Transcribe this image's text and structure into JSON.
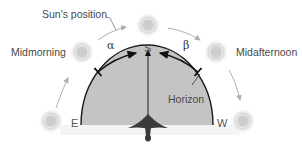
{
  "diagram": {
    "labels": {
      "sun_position": "Sun's position",
      "midmorning": "Midmorning",
      "midafternoon": "Midafternoon",
      "south": "S",
      "east": "E",
      "west": "W",
      "horizon": "Horizon",
      "alpha": "α",
      "beta": "β"
    },
    "suns": [
      {
        "name": "sunrise-east",
        "x": 51,
        "y": 121
      },
      {
        "name": "midmorning",
        "x": 82,
        "y": 52
      },
      {
        "name": "noon-south",
        "x": 148,
        "y": 25
      },
      {
        "name": "midafternoon",
        "x": 216,
        "y": 52
      },
      {
        "name": "sunset-west",
        "x": 243,
        "y": 121
      }
    ],
    "colors": {
      "dome_fill": "#c4c4c4",
      "dome_stroke": "#1a1a1a",
      "sun_glow": "#d6d6d6",
      "path_arrow": "#b0b0b0",
      "bird": "#3a3a3a",
      "angle_arrow": "#111111"
    }
  }
}
